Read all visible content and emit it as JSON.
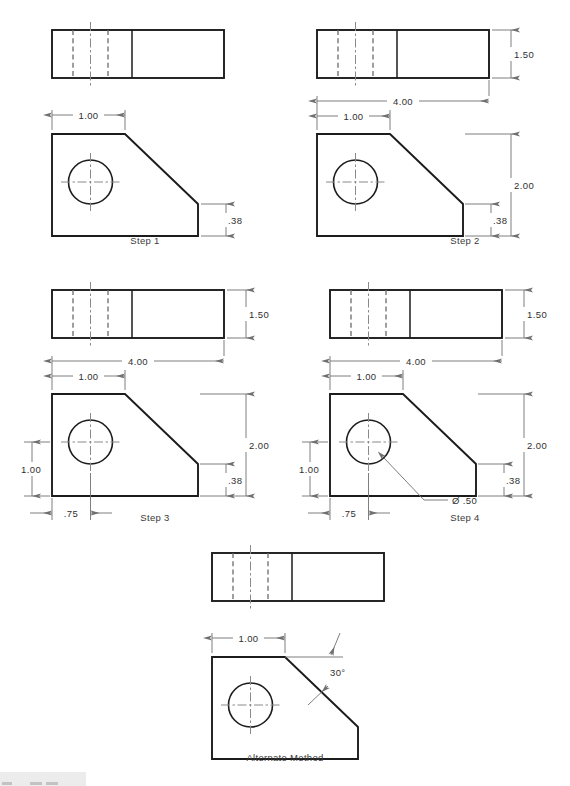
{
  "page": {
    "background_color": "#ffffff",
    "object_line_color": "#1c1c1c",
    "hidden_line_color": "#6b6b6b",
    "center_line_color": "#8a8a8a",
    "dimension_line_color": "#707070",
    "text_color": "#303030"
  },
  "panels": [
    {
      "id": "step1",
      "caption": "Step 1",
      "dimensions": [
        {
          "name": "front-width-partial",
          "value": "1.00"
        },
        {
          "name": "front-right-height",
          "value": ".38"
        }
      ]
    },
    {
      "id": "step2",
      "caption": "Step 2",
      "dimensions": [
        {
          "name": "top-depth",
          "value": "1.50"
        },
        {
          "name": "front-overall-width",
          "value": "4.00"
        },
        {
          "name": "front-width-partial",
          "value": "1.00"
        },
        {
          "name": "front-overall-height",
          "value": "2.00"
        },
        {
          "name": "front-right-height",
          "value": ".38"
        }
      ]
    },
    {
      "id": "step3",
      "caption": "Step 3",
      "dimensions": [
        {
          "name": "top-depth",
          "value": "1.50"
        },
        {
          "name": "front-overall-width",
          "value": "4.00"
        },
        {
          "name": "front-width-partial",
          "value": "1.00"
        },
        {
          "name": "front-overall-height",
          "value": "2.00"
        },
        {
          "name": "front-right-height",
          "value": ".38"
        },
        {
          "name": "hole-height-from-base",
          "value": "1.00"
        },
        {
          "name": "hole-offset-from-left",
          "value": ".75"
        }
      ]
    },
    {
      "id": "step4",
      "caption": "Step 4",
      "dimensions": [
        {
          "name": "top-depth",
          "value": "1.50"
        },
        {
          "name": "front-overall-width",
          "value": "4.00"
        },
        {
          "name": "front-width-partial",
          "value": "1.00"
        },
        {
          "name": "front-overall-height",
          "value": "2.00"
        },
        {
          "name": "front-right-height",
          "value": ".38"
        },
        {
          "name": "hole-height-from-base",
          "value": "1.00"
        },
        {
          "name": "hole-offset-from-left",
          "value": ".75"
        },
        {
          "name": "hole-diameter-callout",
          "value": "Ø .50"
        }
      ]
    },
    {
      "id": "alternate",
      "caption": "Alternate Method",
      "dimensions": [
        {
          "name": "front-width-partial",
          "value": "1.00"
        },
        {
          "name": "bevel-angle",
          "value": "30°"
        }
      ]
    }
  ],
  "labels": {
    "step1": "Step 1",
    "step2": "Step 2",
    "step3": "Step 3",
    "step4": "Step 4",
    "alternate": "Alternate Method",
    "d_1_00": "1.00",
    "d_38": ".38",
    "d_1_50": "1.50",
    "d_4_00": "4.00",
    "d_2_00": "2.00",
    "d_75": ".75",
    "d_dia_50": "Ø .50",
    "d_30deg": "30°"
  }
}
